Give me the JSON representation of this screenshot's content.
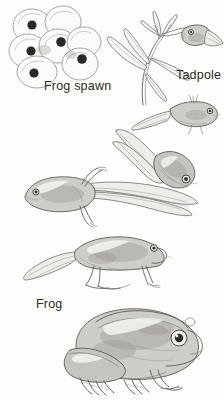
{
  "image": {
    "title": "Frog life cycle illustration",
    "style": "pencil drawing",
    "background_color": "#fdfdfc",
    "ink_color": "#5d5a57",
    "label_color": "#2c2a28",
    "width": 224,
    "height": 400
  },
  "labels": {
    "frog_spawn": "Frog spawn",
    "tadpole": "Tadpole",
    "frog": "Frog"
  },
  "stages": [
    {
      "id": "frog-spawn",
      "label": "Frog spawn",
      "description": "Cluster of seven translucent jelly eggs, five with dark embryo nuclei visible",
      "egg_count": 7,
      "nucleus_count": 5
    },
    {
      "id": "tadpole-on-pondweed",
      "label": "Tadpole",
      "description": "Newly hatched tadpole clinging to a pondweed stem with narrow leaves"
    },
    {
      "id": "tadpole-external-gills",
      "label": "",
      "description": "Small tadpole with feathery external gills swimming free"
    },
    {
      "id": "tadpole-swimming",
      "label": "",
      "description": "Larger tadpole with a broad finned tail"
    },
    {
      "id": "tadpole-hind-legs",
      "label": "",
      "description": "Tadpole with developing hind legs and long tail"
    },
    {
      "id": "froglet",
      "label": "",
      "description": "Froglet with four legs and a shrinking tail"
    },
    {
      "id": "adult-frog",
      "label": "Frog",
      "description": "Adult frog with no tail, webbed hind feet and large eye"
    }
  ]
}
